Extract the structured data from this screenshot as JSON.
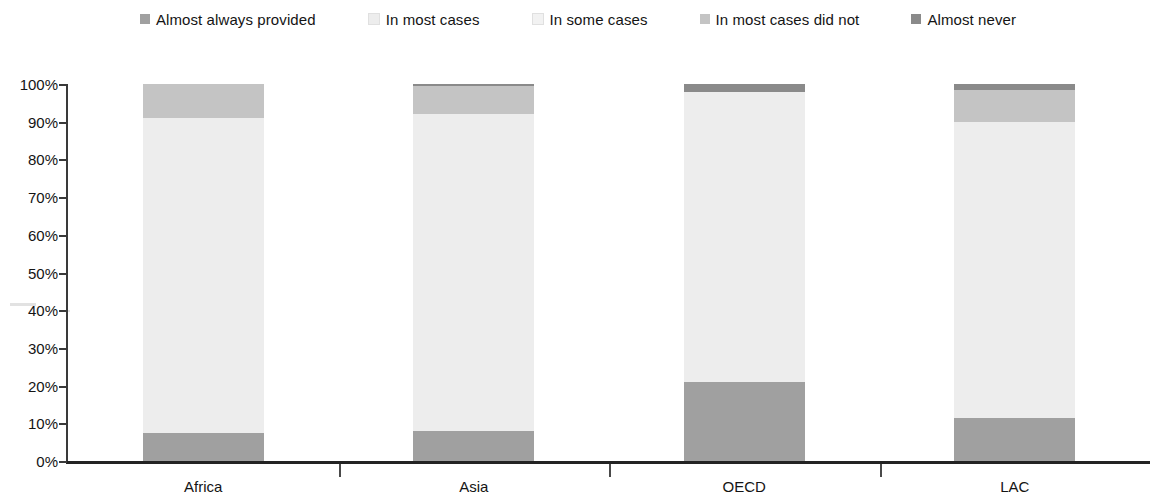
{
  "legend": {
    "position": "top",
    "items": [
      {
        "label": "Almost always provided",
        "color": "#a0a0a0",
        "swatch_icon": "square-swatch-icon"
      },
      {
        "label": "In most cases",
        "color": "#ededed",
        "swatch_icon": "square-swatch-icon"
      },
      {
        "label": "In some cases",
        "color": "#f2f2f2",
        "swatch_icon": "square-swatch-icon"
      },
      {
        "label": "In most cases did not",
        "color": "#c4c4c4",
        "swatch_icon": "square-swatch-icon"
      },
      {
        "label": "Almost never",
        "color": "#8a8a8a",
        "swatch_icon": "square-swatch-icon"
      }
    ]
  },
  "axes": {
    "y_ticks": [
      "0%",
      "10%",
      "20%",
      "30%",
      "40%",
      "50%",
      "60%",
      "70%",
      "80%",
      "90%",
      "100%"
    ],
    "x_categories": [
      "Africa",
      "Asia",
      "OECD",
      "LAC"
    ]
  },
  "chart_data": {
    "type": "bar",
    "stacked": true,
    "orientation": "vertical",
    "title": "",
    "subtitle": "",
    "xlabel": "",
    "ylabel": "",
    "ylim": [
      0,
      100
    ],
    "ytick_values": [
      0,
      10,
      20,
      30,
      40,
      50,
      60,
      70,
      80,
      90,
      100
    ],
    "ytick_labels": [
      "0%",
      "10%",
      "20%",
      "30%",
      "40%",
      "50%",
      "60%",
      "70%",
      "80%",
      "90%",
      "100%"
    ],
    "grid": false,
    "legend_position": "top",
    "categories": [
      "Africa",
      "Asia",
      "OECD",
      "LAC"
    ],
    "series": [
      {
        "name": "Almost always provided",
        "color": "#a0a0a0",
        "values": [
          7.4,
          8.0,
          21.0,
          11.4
        ]
      },
      {
        "name": "In most cases",
        "color": "#ededed",
        "values": [
          83.6,
          84.0,
          77.0,
          78.6
        ]
      },
      {
        "name": "In some cases",
        "color": "#f2f2f2",
        "values": [
          0,
          0,
          0,
          0
        ]
      },
      {
        "name": "In most cases did not",
        "color": "#c4c4c4",
        "values": [
          9.0,
          7.4,
          0,
          8.5
        ]
      },
      {
        "name": "Almost never",
        "color": "#8a8a8a",
        "values": [
          0,
          0.6,
          2.0,
          1.5
        ]
      }
    ]
  }
}
